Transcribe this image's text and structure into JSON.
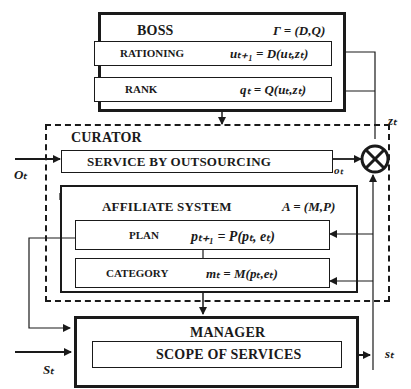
{
  "boss": {
    "title": "BOSS",
    "formula": "Γ = (D,Q)",
    "rationing": {
      "label": "RATIONING",
      "formula": "uₜ₊₁ = D(uₜ,zₜ)"
    },
    "rank": {
      "label": "RANK",
      "formula": "qₜ = Q(uₜ,zₜ)"
    }
  },
  "curator": {
    "title": "CURATOR",
    "service": {
      "label": "SERVICE BY OUTSOURCING"
    },
    "affiliate": {
      "title": "AFFILIATE SYSTEM",
      "formula": "A = (M,P)",
      "plan": {
        "label": "PLAN",
        "formula": "pₜ₊₁ = P(pₜ, eₜ)"
      },
      "category": {
        "label": "CATEGORY",
        "formula": "mₜ = M(pₜ,eₜ)"
      }
    }
  },
  "manager": {
    "title": "MANAGER",
    "scope": {
      "label": "SCOPE OF SERVICES"
    }
  },
  "variables": {
    "o_in": "Oₜ",
    "o_out": "oₜ",
    "z": "zₜ",
    "s_in": "Sₜ",
    "s_out": "sₜ"
  },
  "symbols": {
    "combiner": "⊗"
  }
}
